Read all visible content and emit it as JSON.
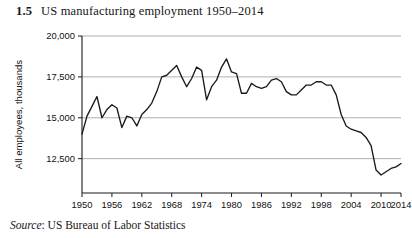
{
  "figure": {
    "number": "1.5",
    "title": "US manufacturing employment 1950–2014",
    "source_label": "Source",
    "source_separator": ":",
    "source_text": "US Bureau of Labor Statistics"
  },
  "chart_data": {
    "type": "line",
    "title": "US manufacturing employment 1950–2014",
    "xlabel": "",
    "ylabel": "All employees, thousands",
    "xlim": [
      1950,
      2014
    ],
    "ylim": [
      10400,
      20000
    ],
    "yticks": [
      12500,
      15000,
      17500,
      20000
    ],
    "ytick_labels": [
      "12,500",
      "15,000",
      "17,500",
      "20,000"
    ],
    "xticks": [
      1950,
      1956,
      1962,
      1968,
      1974,
      1980,
      1986,
      1992,
      1998,
      2004,
      2010,
      2014
    ],
    "xtick_labels": [
      "1950",
      "1956",
      "1962",
      "1968",
      "1974",
      "1980",
      "1986",
      "1992",
      "1998",
      "2004",
      "2010",
      "2014"
    ],
    "grid": "horizontal",
    "legend": "none",
    "line_color": "#1a1a1a",
    "grid_color": "#9a9a9a",
    "axis_color": "#1a1a1a",
    "x": [
      1950,
      1951,
      1952,
      1953,
      1954,
      1955,
      1956,
      1957,
      1958,
      1959,
      1960,
      1961,
      1962,
      1963,
      1964,
      1965,
      1966,
      1967,
      1968,
      1969,
      1970,
      1971,
      1972,
      1973,
      1974,
      1975,
      1976,
      1977,
      1978,
      1979,
      1980,
      1981,
      1982,
      1983,
      1984,
      1985,
      1986,
      1987,
      1988,
      1989,
      1990,
      1991,
      1992,
      1993,
      1994,
      1995,
      1996,
      1997,
      1998,
      1999,
      2000,
      2001,
      2002,
      2003,
      2004,
      2005,
      2006,
      2007,
      2008,
      2009,
      2010,
      2011,
      2012,
      2013,
      2014
    ],
    "values": [
      14000,
      15100,
      15700,
      16300,
      15000,
      15500,
      15800,
      15600,
      14400,
      15100,
      15000,
      14500,
      15200,
      15500,
      15900,
      16600,
      17500,
      17600,
      17900,
      18200,
      17500,
      16900,
      17400,
      18100,
      17900,
      16100,
      16900,
      17300,
      18100,
      18600,
      17800,
      17700,
      16500,
      16500,
      17100,
      16900,
      16800,
      16900,
      17300,
      17400,
      17200,
      16600,
      16400,
      16400,
      16700,
      17000,
      17000,
      17200,
      17200,
      17000,
      17000,
      16400,
      15200,
      14500,
      14300,
      14200,
      14100,
      13800,
      13300,
      11800,
      11500,
      11700,
      11900,
      12000,
      12200
    ]
  }
}
